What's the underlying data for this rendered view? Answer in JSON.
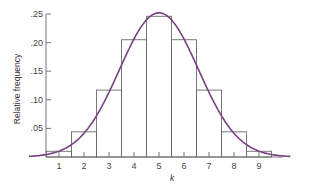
{
  "chart_data": {
    "type": "bar",
    "title": "",
    "xlabel": "k",
    "ylabel": "Relative frequency",
    "categories": [
      "1",
      "2",
      "3",
      "4",
      "5",
      "6",
      "7",
      "8",
      "9"
    ],
    "values": [
      0.01,
      0.044,
      0.117,
      0.205,
      0.246,
      0.205,
      0.117,
      0.044,
      0.01
    ],
    "overlay": {
      "type": "line",
      "description": "normal curve approximation",
      "mean": 5,
      "sd": 1.58,
      "color": "#7b3f86"
    },
    "yticks": [
      ".05",
      ".10",
      ".15",
      ".20",
      ".25"
    ],
    "ylim": [
      0,
      0.25
    ],
    "xlim": [
      0.5,
      10
    ],
    "grid": false,
    "legend": null
  },
  "colors": {
    "bars_outline": "#6b6b6b",
    "curve": "#7b3f86",
    "axis": "#777777"
  }
}
